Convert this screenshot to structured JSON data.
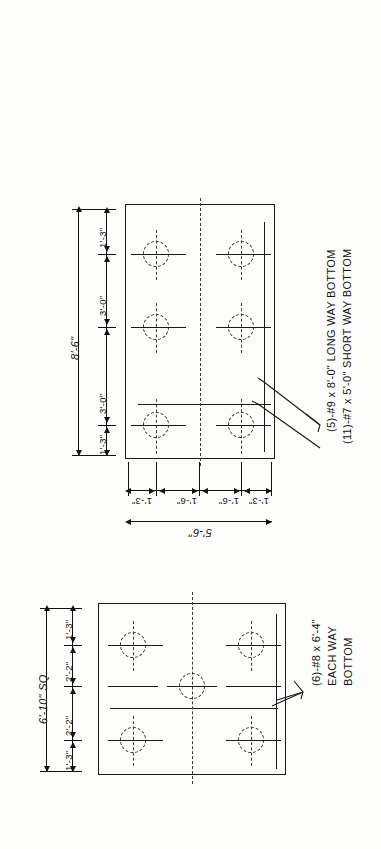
{
  "drawing": {
    "title": "Spread Footing Reinforcing Plans",
    "orientation": "rotated-90",
    "ink_color": "#1a1a1a",
    "paper_color": "#fdfdfc"
  },
  "footing_upper": {
    "name": "rectangular-footing-plan",
    "overall_long": "8'-6\"",
    "overall_short": "5'-6\"",
    "long_spacing": [
      "1'-3\"",
      "3'-0\"",
      "3'-0\"",
      "1'-3\""
    ],
    "short_spacing": [
      "1'-3\"",
      "1'-6\"",
      "1'-6\"",
      "1'-3\""
    ],
    "bolt_count": 6,
    "note_line_1": "(5)-#9 x 8'-0\" LONG WAY BOTTOM",
    "note_line_2": "(11)-#7 x 5'-0\" SHORT WAY BOTTOM"
  },
  "footing_lower": {
    "name": "square-footing-plan",
    "overall": "6'-10\" SQ.",
    "spacing": [
      "1'-3\"",
      "2'-2\"",
      "2'-2\"",
      "1'-3\""
    ],
    "bolt_count": 5,
    "note_line_1": "(6)-#8 x 6'-4\"",
    "note_line_2": "EACH WAY",
    "note_line_3": "BOTTOM"
  }
}
